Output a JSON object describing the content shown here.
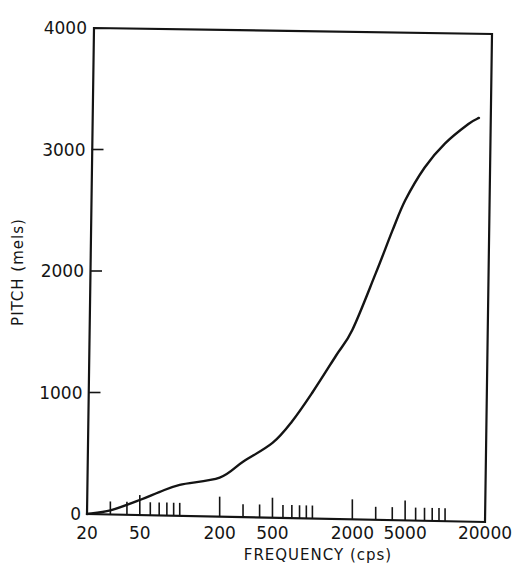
{
  "chart_data": {
    "type": "line",
    "title": "",
    "xlabel": "FREQUENCY (cps)",
    "ylabel": "PITCH (mels)",
    "xscale": "log",
    "xlim": [
      20,
      20000
    ],
    "ylim": [
      0,
      4000
    ],
    "grid": false,
    "legend": null,
    "x_tick_labels": [
      "20",
      "50",
      "200",
      "500",
      "2000",
      "5000",
      "20000"
    ],
    "x_tick_values": [
      20,
      50,
      200,
      500,
      2000,
      5000,
      20000
    ],
    "x_minor_ticks": [
      30,
      40,
      50,
      60,
      70,
      80,
      90,
      100,
      200,
      300,
      400,
      500,
      600,
      700,
      800,
      900,
      1000,
      2000,
      3000,
      4000,
      5000,
      6000,
      7000,
      8000,
      9000,
      10000
    ],
    "y_tick_labels": [
      "0",
      "1000",
      "2000",
      "3000",
      "4000"
    ],
    "y_tick_values": [
      0,
      1000,
      2000,
      3000,
      4000
    ],
    "series": [
      {
        "name": "Pitch vs frequency",
        "x": [
          20,
          30,
          50,
          70,
          100,
          200,
          300,
          500,
          700,
          1000,
          1500,
          2000,
          3000,
          4000,
          5000,
          7000,
          10000,
          15000,
          18000
        ],
        "y": [
          0,
          30,
          115,
          180,
          240,
          300,
          430,
          585,
          760,
          1000,
          1300,
          1515,
          1980,
          2330,
          2580,
          2850,
          3050,
          3210,
          3260
        ]
      }
    ]
  }
}
